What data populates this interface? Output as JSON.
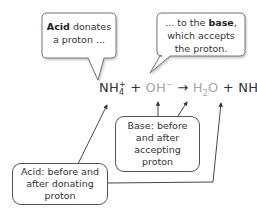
{
  "bubbles": {
    "acid": {
      "bold": "Acid",
      "text_after_bold": " donates a proton ..."
    },
    "base": {
      "text_before_bold": "... to the ",
      "bold": "base",
      "text_after_bold": ", which accepts the proton."
    }
  },
  "equation": {
    "reactant1": {
      "base": "NH",
      "sub": "4",
      "sup": "+"
    },
    "plus1": "+",
    "reactant2": {
      "base": "OH",
      "sup": "−"
    },
    "arrow": "→",
    "product1": {
      "base1": "H",
      "sub": "2",
      "base2": "O"
    },
    "plus2": "+",
    "product2": {
      "base": "NH",
      "sub": "3"
    }
  },
  "labels": {
    "base_box": "Base: before and after accepting proton",
    "acid_box": "Acid: before and after donating proton"
  },
  "colors": {
    "acid_species": "#333333",
    "base_species": "#a8a8a8",
    "lines": "#444444"
  }
}
